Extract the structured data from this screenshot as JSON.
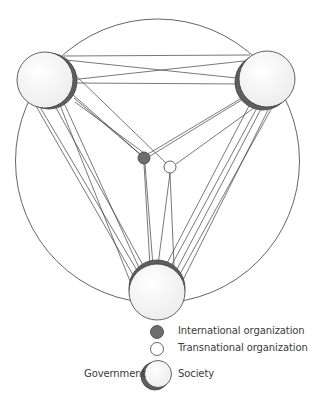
{
  "diagram": {
    "type": "network",
    "colors": {
      "stroke": "#3d3d3d",
      "node_fill": "#f4f4f4",
      "crescent": "#5e5e5e",
      "international_fill": "#6d6d6d",
      "transnational_fill": "#ffffff"
    },
    "boundary_circle": {
      "cx": 157.5,
      "cy": 161,
      "r": 142
    },
    "nodes": [
      {
        "id": "country-left",
        "kind": "government-society",
        "cx": 45,
        "cy": 80,
        "r": 28,
        "crescent_dx": 4,
        "crescent_dy": 1
      },
      {
        "id": "country-right",
        "kind": "government-society",
        "cx": 267,
        "cy": 79,
        "r": 28,
        "crescent_dx": -4,
        "crescent_dy": 3
      },
      {
        "id": "country-bottom",
        "kind": "government-society",
        "cx": 157,
        "cy": 292,
        "r": 28,
        "crescent_dx": 0,
        "crescent_dy": -4
      },
      {
        "id": "international-org",
        "kind": "international",
        "cx": 144,
        "cy": 158,
        "r": 6
      },
      {
        "id": "transnational-org",
        "kind": "transnational",
        "cx": 170,
        "cy": 167,
        "r": 6
      }
    ],
    "edges": [
      [
        64,
        56,
        250,
        55
      ],
      [
        66,
        60,
        246,
        79
      ],
      [
        70,
        80,
        244,
        61
      ],
      [
        74,
        83,
        246,
        84
      ],
      [
        72,
        94,
        140,
        154
      ],
      [
        74,
        98,
        142,
        156
      ],
      [
        75,
        102,
        144,
        153
      ],
      [
        70,
        70,
        166,
        163
      ],
      [
        250,
        93,
        148,
        154
      ],
      [
        248,
        96,
        150,
        156
      ],
      [
        258,
        105,
        176,
        164
      ],
      [
        144,
        164,
        150,
        266
      ],
      [
        145,
        164,
        153,
        266
      ],
      [
        170,
        173,
        158,
        265
      ],
      [
        170,
        173,
        174,
        266
      ],
      [
        36,
        106,
        133,
        275
      ],
      [
        40,
        107,
        138,
        272
      ],
      [
        55,
        106,
        144,
        267
      ],
      [
        60,
        105,
        130,
        281
      ],
      [
        64,
        103,
        140,
        270
      ],
      [
        258,
        106,
        170,
        268
      ],
      [
        262,
        107,
        176,
        271
      ],
      [
        270,
        106,
        183,
        280
      ],
      [
        274,
        104,
        180,
        274
      ],
      [
        250,
        104,
        165,
        267
      ]
    ]
  },
  "legend": {
    "international_label": "International organization",
    "transnational_label": "Transnational organization",
    "government_label": "Government",
    "society_label": "Society"
  }
}
